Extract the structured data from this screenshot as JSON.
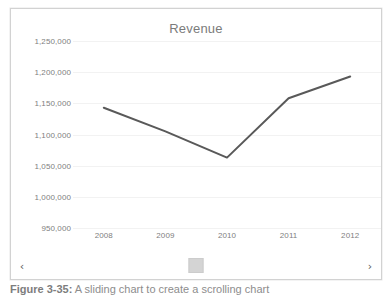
{
  "chart_data": {
    "type": "line",
    "title": "Revenue",
    "xlabel": "",
    "ylabel": "",
    "x": [
      "2008",
      "2009",
      "2010",
      "2011",
      "2012"
    ],
    "categories": [
      "2008",
      "2009",
      "2010",
      "2011",
      "2012"
    ],
    "values": [
      1143000,
      1105000,
      1063000,
      1158000,
      1193000
    ],
    "series": [
      {
        "name": "Revenue",
        "values": [
          1143000,
          1105000,
          1063000,
          1158000,
          1193000
        ],
        "color": "#595959"
      }
    ],
    "ylim": [
      950000,
      1250000
    ],
    "ytick_values": [
      1250000,
      1200000,
      1150000,
      1100000,
      1050000,
      1000000,
      950000
    ],
    "ytick_labels": [
      "1,250,000",
      "1,200,000",
      "1,150,000",
      "1,100,000",
      "1,050,000",
      "1,000,000",
      "950,000"
    ],
    "xtick_labels": [
      "2008",
      "2009",
      "2010",
      "2011",
      "2012"
    ],
    "grid": true,
    "grid_axis": "y",
    "legend": false,
    "legend_position": "none",
    "markers": false,
    "line_color": "#595959",
    "grid_color": "#f2f2f2",
    "tick_label_color": "#808080",
    "title_color": "#7b7b7b",
    "plot_background": "#ffffff"
  },
  "pane": {
    "background": "#ffffff",
    "border_color": "#d2d2d2"
  },
  "scrollbar": {
    "left_arrow": "‹",
    "right_arrow": "›",
    "thumb_color": "#d4d4d4",
    "track_color": "#ffffff",
    "thumb_position_percent": 50
  },
  "caption": {
    "number": "Figure 3-35:",
    "text": "A sliding chart to create a scrolling chart",
    "full": "Figure 3-35:  A sliding chart to create a scrolling chart"
  }
}
